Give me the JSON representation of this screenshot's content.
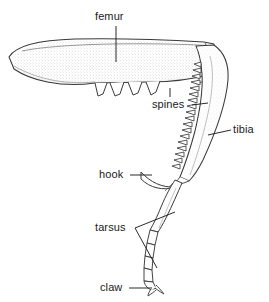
{
  "figure": {
    "type": "anatomical-line-diagram",
    "background_color": "#ffffff",
    "line_color": "#3a3a3a",
    "fill_color": "#ffffff",
    "stipple_color": "#8d8d8d",
    "label_color": "#1a1a1a"
  },
  "labels": {
    "femur": "femur",
    "spines": "spines",
    "tibia": "tibia",
    "hook": "hook",
    "tarsus": "tarsus",
    "claw": "claw"
  },
  "parts": [
    {
      "name": "femur",
      "label": "femur",
      "leader": "vertical-down"
    },
    {
      "name": "spines",
      "label": "spines",
      "leader": "up-and-right"
    },
    {
      "name": "tibia",
      "label": "tibia",
      "leader": "horizontal-left"
    },
    {
      "name": "hook",
      "label": "hook",
      "leader": "horizontal-right"
    },
    {
      "name": "tarsus",
      "label": "tarsus",
      "leader": "forked-right"
    },
    {
      "name": "claw",
      "label": "claw",
      "leader": "horizontal-right"
    }
  ]
}
